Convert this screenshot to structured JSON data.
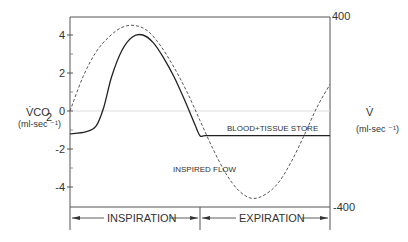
{
  "chart_data": {
    "type": "line",
    "title": "",
    "xlabel": "",
    "left_axis": {
      "label": "V̇CO",
      "label_sub": "2",
      "unit": "(ml-sec ⁻¹)",
      "ylim": [
        -5.2,
        4.8
      ],
      "ticks": [
        4,
        2,
        0,
        -2,
        -4
      ],
      "tick_labels": [
        "4",
        "2",
        "0",
        "-2",
        "-4"
      ]
    },
    "right_axis": {
      "label": "V̇",
      "unit": "(ml-sec ⁻¹)",
      "ylim": [
        -400,
        400
      ],
      "tick_labels": [
        "400",
        "-400"
      ]
    },
    "xlim": [
      0,
      1
    ],
    "series": [
      {
        "name": "BLOOD+TISSUE STORE",
        "style": "solid",
        "axis": "left",
        "x": [
          0,
          0.06,
          0.1,
          0.13,
          0.16,
          0.2,
          0.24,
          0.28,
          0.32,
          0.36,
          0.4,
          0.44,
          0.48,
          0.5,
          0.52,
          0.6,
          0.7,
          0.8,
          0.9,
          1.0
        ],
        "y": [
          -1.2,
          -1.1,
          -0.8,
          0.2,
          1.8,
          3.2,
          3.9,
          4.0,
          3.6,
          2.8,
          1.8,
          0.6,
          -0.7,
          -1.3,
          -1.3,
          -1.3,
          -1.3,
          -1.3,
          -1.3,
          -1.3
        ]
      },
      {
        "name": "INSPIRED FLOW",
        "style": "dashed",
        "axis": "left",
        "x": [
          0,
          0.05,
          0.1,
          0.15,
          0.2,
          0.25,
          0.3,
          0.35,
          0.4,
          0.45,
          0.5,
          0.55,
          0.6,
          0.65,
          0.7,
          0.75,
          0.8,
          0.85,
          0.9,
          0.95,
          1.0
        ],
        "y": [
          0,
          1.8,
          3.1,
          3.9,
          4.4,
          4.5,
          4.2,
          3.4,
          2.3,
          1.0,
          -0.5,
          -2.0,
          -3.3,
          -4.2,
          -4.6,
          -4.4,
          -3.8,
          -2.7,
          -1.3,
          0.2,
          1.4
        ]
      }
    ],
    "annotations": {
      "store_label": "BLOOD+TISSUE STORE",
      "flow_label": "INSPIRED FLOW"
    },
    "phases": [
      {
        "label": "INSPIRATION",
        "from": 0,
        "to": 0.5
      },
      {
        "label": "EXPIRATION",
        "from": 0.5,
        "to": 1.0
      }
    ],
    "grid": false,
    "legend": "none"
  }
}
